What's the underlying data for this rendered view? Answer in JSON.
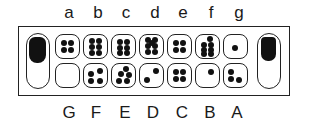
{
  "board": {
    "game": "Mancala",
    "top_labels": [
      "a",
      "b",
      "c",
      "d",
      "e",
      "f",
      "g"
    ],
    "bottom_labels": [
      "G",
      "F",
      "E",
      "D",
      "C",
      "B",
      "A"
    ],
    "top_row": [
      {
        "label": "a",
        "seeds": 4
      },
      {
        "label": "b",
        "seeds": 6
      },
      {
        "label": "c",
        "seeds": 6
      },
      {
        "label": "d",
        "seeds": 7
      },
      {
        "label": "e",
        "seeds": 4
      },
      {
        "label": "f",
        "seeds": 7
      },
      {
        "label": "g",
        "seeds": 1
      }
    ],
    "bottom_row": [
      {
        "label": "G",
        "seeds": 0
      },
      {
        "label": "F",
        "seeds": 4
      },
      {
        "label": "E",
        "seeds": 5
      },
      {
        "label": "D",
        "seeds": 2
      },
      {
        "label": "C",
        "seeds": 4
      },
      {
        "label": "B",
        "seeds": 1
      },
      {
        "label": "A",
        "seeds": 3
      }
    ],
    "left_store": {
      "seeds": "many"
    },
    "right_store": {
      "seeds": "many"
    },
    "colors": {
      "ink": "#111111",
      "background": "#ffffff"
    }
  }
}
